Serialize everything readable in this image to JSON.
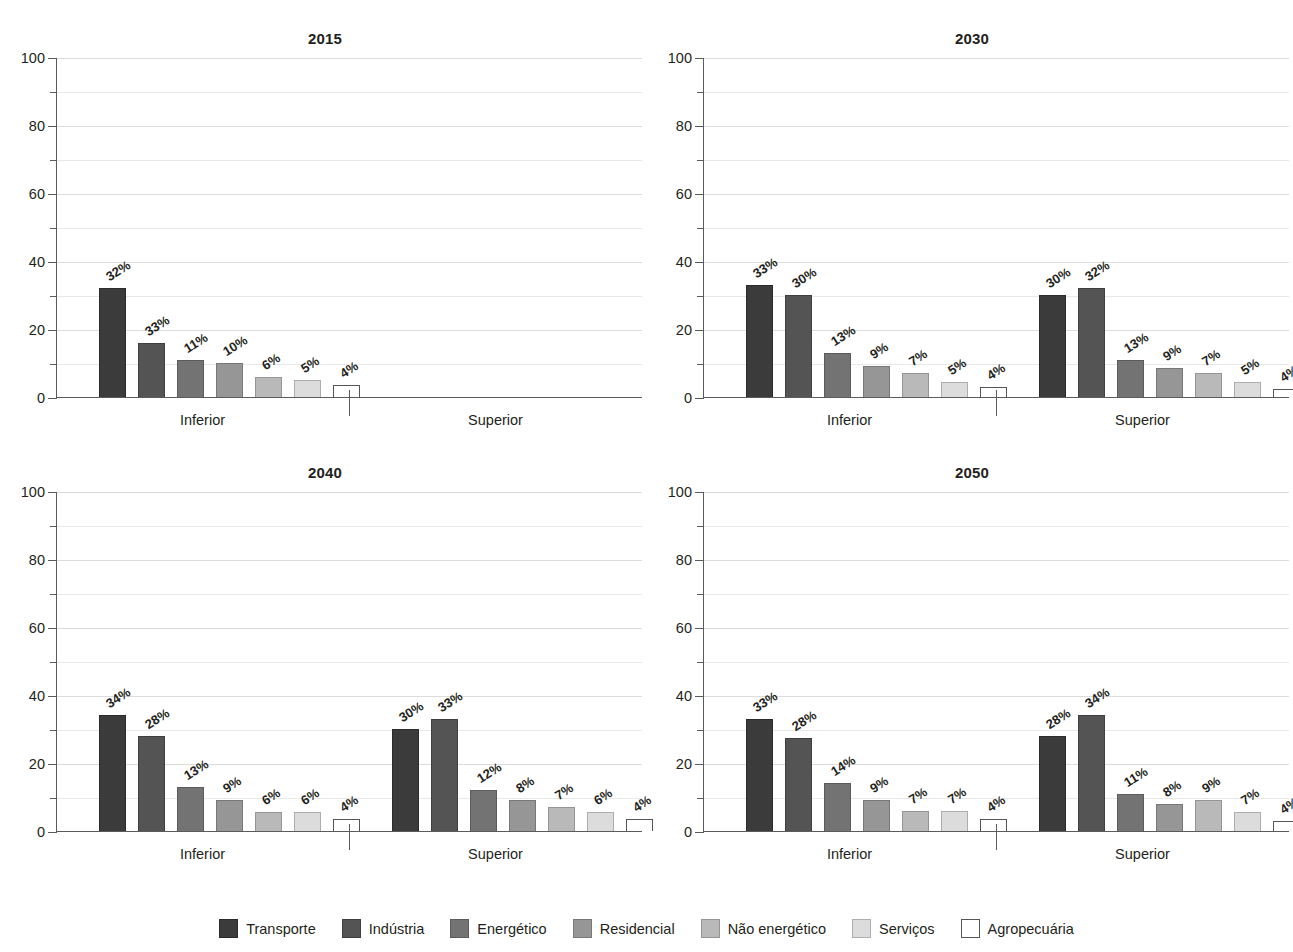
{
  "chart_data": [
    {
      "type": "bar",
      "title": "2015",
      "xlabel": "",
      "ylabel": "",
      "ylim": [
        0,
        100
      ],
      "yticks": [
        0,
        20,
        40,
        60,
        80,
        100
      ],
      "yticks_minor": [
        10,
        30,
        50,
        70,
        90
      ],
      "grid": true,
      "legend_position": "bottom",
      "groups": [
        "Inferior",
        "Superior"
      ],
      "categories": [
        "Transporte",
        "Indústria",
        "Energético",
        "Residencial",
        "Não energético",
        "Serviços",
        "Agropecuária"
      ],
      "series": [
        {
          "name": "Inferior",
          "values": [
            32,
            16,
            11,
            10,
            6,
            5,
            3.5
          ],
          "labels": [
            "32%",
            "33%",
            "11%",
            "10%",
            "6%",
            "5%",
            "4%"
          ]
        },
        {
          "name": "Superior",
          "values": [],
          "labels": []
        }
      ]
    },
    {
      "type": "bar",
      "title": "2030",
      "xlabel": "",
      "ylabel": "",
      "ylim": [
        0,
        100
      ],
      "yticks": [
        0,
        20,
        40,
        60,
        80,
        100
      ],
      "yticks_minor": [
        10,
        30,
        50,
        70,
        90
      ],
      "grid": true,
      "legend_position": "bottom",
      "groups": [
        "Inferior",
        "Superior"
      ],
      "categories": [
        "Transporte",
        "Indústria",
        "Energético",
        "Residencial",
        "Não energético",
        "Serviços",
        "Agropecuária"
      ],
      "series": [
        {
          "name": "Inferior",
          "values": [
            33,
            30,
            13,
            9,
            7,
            4.5,
            3
          ],
          "labels": [
            "33%",
            "30%",
            "13%",
            "9%",
            "7%",
            "5%",
            "4%"
          ]
        },
        {
          "name": "Superior",
          "values": [
            30,
            32,
            11,
            8.5,
            7,
            4.5,
            2.5
          ],
          "labels": [
            "30%",
            "32%",
            "13%",
            "9%",
            "7%",
            "5%",
            "4%"
          ]
        }
      ]
    },
    {
      "type": "bar",
      "title": "2040",
      "xlabel": "",
      "ylabel": "",
      "ylim": [
        0,
        100
      ],
      "yticks": [
        0,
        20,
        40,
        60,
        80,
        100
      ],
      "yticks_minor": [
        10,
        30,
        50,
        70,
        90
      ],
      "grid": true,
      "legend_position": "bottom",
      "groups": [
        "Inferior",
        "Superior"
      ],
      "categories": [
        "Transporte",
        "Indústria",
        "Energético",
        "Residencial",
        "Não energético",
        "Serviços",
        "Agropecuária"
      ],
      "series": [
        {
          "name": "Inferior",
          "values": [
            34,
            28,
            13,
            9,
            5.5,
            5.5,
            3.5
          ],
          "labels": [
            "34%",
            "28%",
            "13%",
            "9%",
            "6%",
            "6%",
            "4%"
          ]
        },
        {
          "name": "Superior",
          "values": [
            30,
            33,
            12,
            9,
            7,
            5.5,
            3.5
          ],
          "labels": [
            "30%",
            "33%",
            "12%",
            "8%",
            "7%",
            "6%",
            "4%"
          ]
        }
      ]
    },
    {
      "type": "bar",
      "title": "2050",
      "xlabel": "",
      "ylabel": "",
      "ylim": [
        0,
        100
      ],
      "yticks": [
        0,
        20,
        40,
        60,
        80,
        100
      ],
      "yticks_minor": [
        10,
        30,
        50,
        70,
        90
      ],
      "grid": true,
      "legend_position": "bottom",
      "groups": [
        "Inferior",
        "Superior"
      ],
      "categories": [
        "Transporte",
        "Indústria",
        "Energético",
        "Residencial",
        "Não energético",
        "Serviços",
        "Agropecuária"
      ],
      "series": [
        {
          "name": "Inferior",
          "values": [
            33,
            27.5,
            14,
            9,
            6,
            6,
            3.5
          ],
          "labels": [
            "33%",
            "28%",
            "14%",
            "9%",
            "7%",
            "7%",
            "4%"
          ]
        },
        {
          "name": "Superior",
          "values": [
            28,
            34,
            11,
            8,
            9,
            5.5,
            3
          ],
          "labels": [
            "28%",
            "34%",
            "11%",
            "8%",
            "9%",
            "7%",
            "4%"
          ]
        }
      ]
    }
  ],
  "legend": {
    "items": [
      {
        "label": "Transporte",
        "color": "#3b3b3b"
      },
      {
        "label": "Indústria",
        "color": "#545454"
      },
      {
        "label": "Energético",
        "color": "#737373"
      },
      {
        "label": "Residencial",
        "color": "#969696"
      },
      {
        "label": "Não energético",
        "color": "#b9b9b9"
      },
      {
        "label": "Serviços",
        "color": "#dcdcdc"
      },
      {
        "label": "Agropecuária",
        "color": "#ffffff"
      }
    ]
  }
}
